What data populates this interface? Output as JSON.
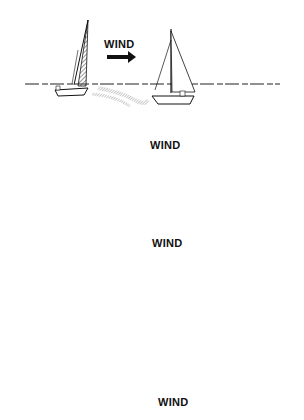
{
  "illustration": {
    "subject": "Sailing boat maneuvers relative to wind direction",
    "panels": [
      {
        "id": 1,
        "wind_label": "WIND",
        "wind_direction": "right",
        "boats": 2
      },
      {
        "id": 2,
        "wind_label": "WIND",
        "wind_direction": "down",
        "boats": 2
      },
      {
        "id": 3,
        "wind_label": "WIND",
        "wind_direction": "up",
        "boats": 2
      },
      {
        "id": 4,
        "wind_label": "WIND",
        "wind_direction": "up-left",
        "boats": 2
      }
    ]
  },
  "colors": {
    "ink": "#111111",
    "hatch": "#555555",
    "wake": "#888888",
    "background": "#ffffff"
  }
}
